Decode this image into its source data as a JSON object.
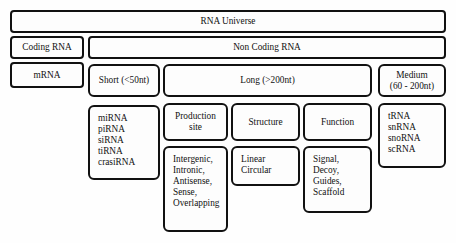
{
  "diagram": {
    "colors": {
      "stroke": "#111111",
      "fill": "#fdfdfd",
      "background": "#ffffff"
    },
    "tier1": {
      "rna_universe": "RNA Universe"
    },
    "tier2": {
      "coding_rna": "Coding RNA",
      "non_coding_rna": "Non Coding RNA"
    },
    "tier3": {
      "mrna": "mRNA",
      "short": "Short (<50nt)",
      "long": "Long (>200nt)",
      "medium_line1": "Medium",
      "medium_line2": "(60 - 200nt)"
    },
    "tier4": {
      "short_species": [
        "miRNA",
        "piRNA",
        "siRNA",
        "tiRNA",
        "crasiRNA"
      ],
      "long_categories": [
        {
          "line1": "Production",
          "line2": "site"
        },
        {
          "line1": "Structure",
          "line2": ""
        },
        {
          "line1": "Function",
          "line2": ""
        }
      ],
      "medium_species": [
        "tRNA",
        "snRNA",
        "snoRNA",
        "scRNA"
      ]
    },
    "tier5": {
      "production_site": [
        "Intergenic,",
        "Intronic,",
        "Antisense,",
        "Sense,",
        "Overlapping"
      ],
      "structure": [
        "Linear",
        "Circular"
      ],
      "function": [
        "Signal,",
        "Decoy,",
        "Guides,",
        "Scaffold"
      ]
    }
  }
}
